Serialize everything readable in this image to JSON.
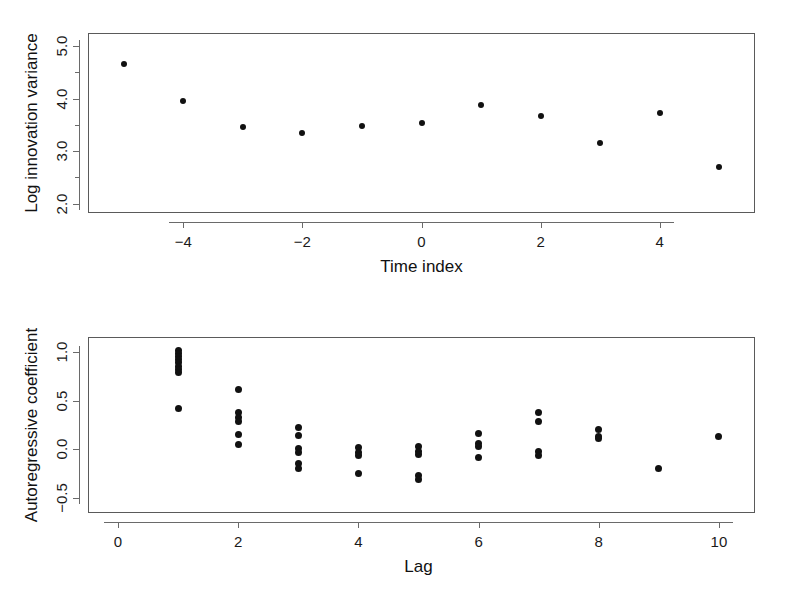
{
  "figure": {
    "background": "#ffffff",
    "marker_color": "#111111",
    "frame_color": "#5a5a5a"
  },
  "chart_data": [
    {
      "id": "top",
      "type": "scatter",
      "title": "",
      "xlabel": "Time index",
      "ylabel": "Log innovation variance",
      "xlim": [
        -5.6,
        5.6
      ],
      "ylim": [
        1.82,
        5.25
      ],
      "xticks": [
        -4,
        -2,
        0,
        2,
        4
      ],
      "xtick_labels": [
        "−4",
        "−2",
        "0",
        "2",
        "4"
      ],
      "yticks": [
        2.0,
        3.0,
        4.0,
        5.0
      ],
      "ytick_labels": [
        "2.0",
        "3.0",
        "4.0",
        "5.0"
      ],
      "minor_yticks": [
        2.5,
        3.5,
        4.5
      ],
      "grid": false,
      "legend": "none",
      "x": [
        -5,
        -4,
        -3,
        -2,
        -1,
        0,
        1,
        2,
        3,
        4,
        5
      ],
      "y": [
        4.65,
        3.95,
        3.45,
        3.35,
        3.48,
        3.53,
        3.88,
        3.67,
        3.15,
        3.72,
        2.7
      ]
    },
    {
      "id": "bottom",
      "type": "scatter",
      "title": "",
      "xlabel": "Lag",
      "ylabel": "Autoregressive coefficient",
      "xlim": [
        -0.5,
        10.6
      ],
      "ylim": [
        -0.66,
        1.16
      ],
      "xticks": [
        0,
        2,
        4,
        6,
        8,
        10
      ],
      "xtick_labels": [
        "0",
        "2",
        "4",
        "6",
        "8",
        "10"
      ],
      "yticks": [
        -0.5,
        0.0,
        0.5,
        1.0
      ],
      "ytick_labels": [
        "−0.5",
        "0.0",
        "0.5",
        "1.0"
      ],
      "grid": false,
      "legend": "none",
      "points": [
        {
          "lag": 1,
          "value": 1.02
        },
        {
          "lag": 1,
          "value": 0.99
        },
        {
          "lag": 1,
          "value": 0.96
        },
        {
          "lag": 1,
          "value": 0.93
        },
        {
          "lag": 1,
          "value": 0.9
        },
        {
          "lag": 1,
          "value": 0.86
        },
        {
          "lag": 1,
          "value": 0.82
        },
        {
          "lag": 1,
          "value": 0.79
        },
        {
          "lag": 1,
          "value": 0.42
        },
        {
          "lag": 2,
          "value": 0.62
        },
        {
          "lag": 2,
          "value": 0.38
        },
        {
          "lag": 2,
          "value": 0.33
        },
        {
          "lag": 2,
          "value": 0.29
        },
        {
          "lag": 2,
          "value": 0.15
        },
        {
          "lag": 2,
          "value": 0.05
        },
        {
          "lag": 3,
          "value": 0.22
        },
        {
          "lag": 3,
          "value": 0.14
        },
        {
          "lag": 3,
          "value": 0.01
        },
        {
          "lag": 3,
          "value": -0.03
        },
        {
          "lag": 3,
          "value": -0.15
        },
        {
          "lag": 3,
          "value": -0.2
        },
        {
          "lag": 4,
          "value": 0.02
        },
        {
          "lag": 4,
          "value": -0.03
        },
        {
          "lag": 4,
          "value": -0.07
        },
        {
          "lag": 4,
          "value": -0.25
        },
        {
          "lag": 5,
          "value": 0.03
        },
        {
          "lag": 5,
          "value": -0.02
        },
        {
          "lag": 5,
          "value": -0.06
        },
        {
          "lag": 5,
          "value": -0.27
        },
        {
          "lag": 5,
          "value": -0.31
        },
        {
          "lag": 6,
          "value": 0.16
        },
        {
          "lag": 6,
          "value": 0.06
        },
        {
          "lag": 6,
          "value": 0.03
        },
        {
          "lag": 6,
          "value": -0.09
        },
        {
          "lag": 7,
          "value": 0.38
        },
        {
          "lag": 7,
          "value": 0.29
        },
        {
          "lag": 7,
          "value": -0.02
        },
        {
          "lag": 7,
          "value": -0.07
        },
        {
          "lag": 8,
          "value": 0.2
        },
        {
          "lag": 8,
          "value": 0.13
        },
        {
          "lag": 8,
          "value": 0.11
        },
        {
          "lag": 9,
          "value": -0.2
        },
        {
          "lag": 10,
          "value": 0.13
        }
      ]
    }
  ]
}
